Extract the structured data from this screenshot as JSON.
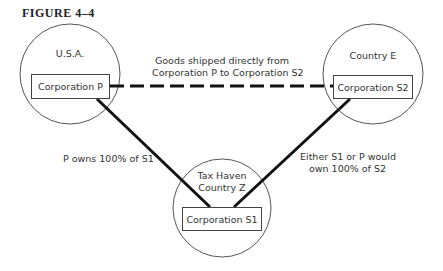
{
  "figure": {
    "title": "FIGURE 4–4"
  },
  "nodes": {
    "usa": {
      "region_label": "U.S.A.",
      "corporation_label": "Corporation P"
    },
    "country_e": {
      "region_label": "Country E",
      "corporation_label": "Corporation S2"
    },
    "country_z": {
      "region_label_line1": "Tax Haven",
      "region_label_line2": "Country Z",
      "corporation_label": "Corporation S1"
    }
  },
  "edges": {
    "p_to_s2": {
      "style": "dashed",
      "label_line1": "Goods shipped directly from",
      "label_line2": "Corporation P to Corporation S2"
    },
    "p_to_s1": {
      "style": "solid",
      "label": "P owns 100% of S1"
    },
    "s1_to_s2": {
      "style": "solid",
      "label_line1": "Either S1 or P would",
      "label_line2": "own 100% of S2"
    }
  },
  "colors": {
    "line": "#111111",
    "circle": "#555555",
    "text": "#333333"
  }
}
